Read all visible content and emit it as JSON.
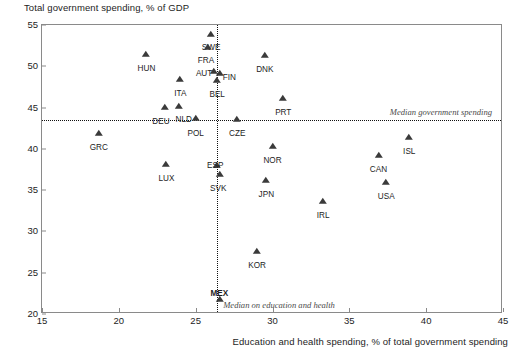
{
  "chart_data": {
    "type": "scatter",
    "title": "",
    "ylabel": "Total government spending, % of GDP",
    "xlabel": "Education and health spending, % of total government spending",
    "xlim": [
      15,
      45
    ],
    "ylim": [
      20,
      55
    ],
    "xticks": [
      15,
      20,
      25,
      30,
      35,
      40,
      45
    ],
    "yticks": [
      20,
      25,
      30,
      35,
      40,
      45,
      50,
      55
    ],
    "grid": false,
    "legend": "none",
    "annotations": [
      {
        "name": "median-government-spending",
        "text": "Median government spending",
        "type": "hline",
        "value": 43.5
      },
      {
        "name": "median-on-education-and-health",
        "text": "Median on education and health",
        "type": "vline",
        "value": 26.4
      }
    ],
    "points": [
      {
        "label": "SWE",
        "x": 26.0,
        "y": 53.9,
        "lx": 0,
        "ly": 10,
        "bold": false
      },
      {
        "label": "FRA",
        "x": 25.8,
        "y": 52.3,
        "lx": -2,
        "ly": 10,
        "bold": false
      },
      {
        "label": "HUN",
        "x": 21.8,
        "y": 51.5,
        "lx": 0,
        "ly": 11,
        "bold": false
      },
      {
        "label": "DNK",
        "x": 29.5,
        "y": 51.4,
        "lx": 0,
        "ly": 11,
        "bold": false
      },
      {
        "label": "AUT",
        "x": 26.2,
        "y": 49.4,
        "lx": -10,
        "ly": -1,
        "bold": false
      },
      {
        "label": "FIN",
        "x": 26.6,
        "y": 49.2,
        "lx": 9,
        "ly": 1,
        "bold": false
      },
      {
        "label": "ITA",
        "x": 24.0,
        "y": 48.5,
        "lx": 0,
        "ly": 11,
        "bold": false
      },
      {
        "label": "BEL",
        "x": 26.4,
        "y": 48.3,
        "lx": 0,
        "ly": 11,
        "bold": false
      },
      {
        "label": "NLD",
        "x": 23.9,
        "y": 45.2,
        "lx": 5,
        "ly": 10,
        "bold": false
      },
      {
        "label": "DEU",
        "x": 23.0,
        "y": 45.1,
        "lx": -4,
        "ly": 11,
        "bold": false
      },
      {
        "label": "POL",
        "x": 25.0,
        "y": 43.7,
        "lx": 0,
        "ly": 12,
        "bold": false
      },
      {
        "label": "CZE",
        "x": 27.7,
        "y": 43.6,
        "lx": 0,
        "ly": 11,
        "bold": false
      },
      {
        "label": "PRT",
        "x": 30.7,
        "y": 46.1,
        "lx": 0,
        "ly": 11,
        "bold": false
      },
      {
        "label": "GRC",
        "x": 18.7,
        "y": 41.9,
        "lx": 0,
        "ly": 11,
        "bold": false
      },
      {
        "label": "ISL",
        "x": 38.9,
        "y": 41.4,
        "lx": 0,
        "ly": 11,
        "bold": false
      },
      {
        "label": "NOR",
        "x": 30.0,
        "y": 40.3,
        "lx": 0,
        "ly": 11,
        "bold": false
      },
      {
        "label": "CAN",
        "x": 36.9,
        "y": 39.2,
        "lx": 0,
        "ly": 11,
        "bold": false
      },
      {
        "label": "ESP",
        "x": 26.4,
        "y": 38.1,
        "lx": -2,
        "ly": -3,
        "bold": false
      },
      {
        "label": "LUX",
        "x": 23.1,
        "y": 38.2,
        "lx": 0,
        "ly": 11,
        "bold": false
      },
      {
        "label": "SVK",
        "x": 26.6,
        "y": 36.9,
        "lx": -2,
        "ly": 11,
        "bold": false
      },
      {
        "label": "JPN",
        "x": 29.6,
        "y": 36.2,
        "lx": 0,
        "ly": 11,
        "bold": false
      },
      {
        "label": "USA",
        "x": 37.4,
        "y": 36.0,
        "lx": 0,
        "ly": 11,
        "bold": false
      },
      {
        "label": "IRL",
        "x": 33.3,
        "y": 33.7,
        "lx": 0,
        "ly": 11,
        "bold": false
      },
      {
        "label": "KOR",
        "x": 29.0,
        "y": 27.6,
        "lx": 0,
        "ly": 11,
        "bold": false
      },
      {
        "label": "MEX",
        "x": 26.6,
        "y": 21.8,
        "lx": -1,
        "ly": -9,
        "bold": true
      }
    ]
  }
}
